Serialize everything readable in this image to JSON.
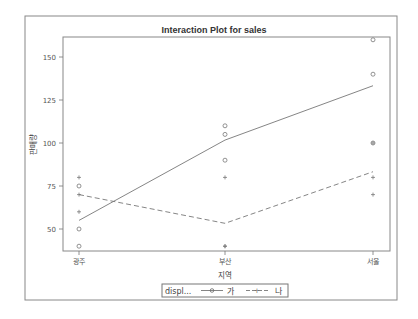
{
  "chart_data": {
    "type": "line",
    "title": "Interaction Plot for sales",
    "xlabel": "지역",
    "ylabel": "판매량",
    "categories": [
      "광주",
      "부산",
      "서울"
    ],
    "ylim": [
      38,
      162
    ],
    "yticks": [
      50,
      75,
      100,
      125,
      150
    ],
    "grid": false,
    "legend_position": "bottom",
    "legend_title": "displ...",
    "series": [
      {
        "name": "가",
        "style": "solid",
        "marker": "circle",
        "means": [
          55,
          101.7,
          133.3
        ],
        "points": [
          [
            75,
            50,
            40
          ],
          [
            110,
            105,
            90
          ],
          [
            160,
            140,
            100
          ]
        ]
      },
      {
        "name": "나",
        "style": "dashed",
        "marker": "plus",
        "means": [
          70,
          53.3,
          83.3
        ],
        "points": [
          [
            80,
            70,
            60
          ],
          [
            80,
            40,
            40
          ],
          [
            100,
            80,
            70
          ]
        ]
      }
    ]
  }
}
